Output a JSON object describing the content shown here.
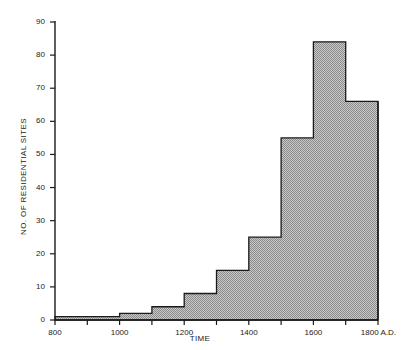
{
  "chart_data": {
    "type": "bar",
    "title": "",
    "xlabel": "TIME",
    "ylabel": "NO. OF RESIDENTIAL SITES",
    "xlim": [
      800,
      1800
    ],
    "ylim": [
      0,
      90
    ],
    "grid": false,
    "legend": null,
    "bin_width": 100,
    "bin_edges": [
      800,
      900,
      1000,
      1100,
      1200,
      1300,
      1400,
      1500,
      1600,
      1700,
      1800
    ],
    "categories": [
      "800-900",
      "900-1000",
      "1000-1100",
      "1100-1200",
      "1200-1300",
      "1300-1400",
      "1400-1500",
      "1500-1600",
      "1600-1700",
      "1700-1800"
    ],
    "values": [
      1,
      1,
      2,
      4,
      8,
      15,
      25,
      55,
      84,
      66
    ],
    "yticks": [
      0,
      10,
      20,
      30,
      40,
      50,
      60,
      70,
      80,
      90
    ],
    "ytick_labels": [
      "0",
      "10",
      "20",
      "30",
      "40",
      "50",
      "60",
      "70",
      "80",
      "90"
    ],
    "xticks": [
      800,
      900,
      1000,
      1100,
      1200,
      1300,
      1400,
      1500,
      1600,
      1700,
      1800
    ],
    "xtick_labels": [
      "800",
      "",
      "1000",
      "",
      "1200",
      "",
      "1400",
      "",
      "1600",
      "",
      "1800 A.D."
    ],
    "bar_fill_color": "#a8a8a8",
    "bar_edge_color": "#1a1a1a",
    "axis_color": "#1a1a1a",
    "background_color": "#ffffff"
  }
}
